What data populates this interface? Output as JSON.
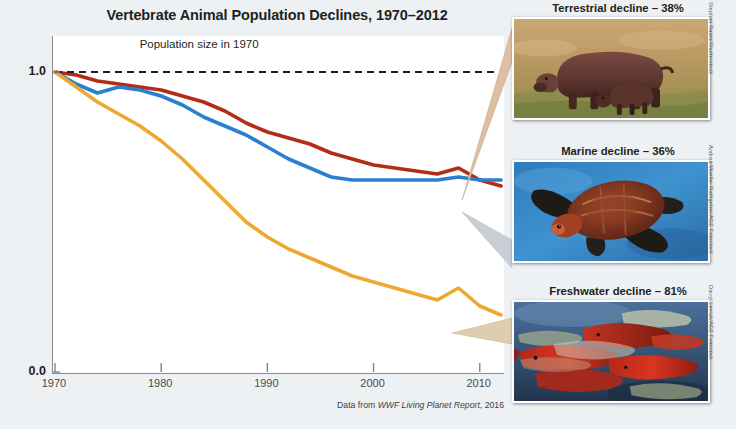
{
  "chart_data": {
    "type": "line",
    "title": "Vertebrate Animal Population Declines, 1970–2012",
    "xlabel": "",
    "ylabel": "Index value (1.0 = 1970)",
    "xlim": [
      1970,
      2012
    ],
    "ylim": [
      0.0,
      1.12
    ],
    "grid": false,
    "legend_position": "annotated-photos-right",
    "x_ticks": [
      "1970",
      "1980",
      "1990",
      "2000",
      "2010"
    ],
    "x_tick_values": [
      1970,
      1980,
      1990,
      2000,
      2010
    ],
    "y_ticks": [
      "1.0",
      "0.0"
    ],
    "y_tick_values": [
      1.0,
      0.0
    ],
    "annotations": [
      {
        "text": "Population size in 1970",
        "x": 1984,
        "y": 1.06,
        "kind": "reference-line-label"
      }
    ],
    "reference_line": {
      "y": 1.0,
      "style": "dashed",
      "color": "#231f20",
      "label": "Population size in 1970"
    },
    "source": "Data from WWF Living Planet Report, 2016",
    "source_prefix": "Data from ",
    "source_italic": "WWF Living Planet Report",
    "source_suffix": ", 2016",
    "x": [
      1970,
      1972,
      1974,
      1976,
      1978,
      1980,
      1982,
      1984,
      1986,
      1988,
      1990,
      1992,
      1994,
      1996,
      1998,
      2000,
      2002,
      2004,
      2006,
      2008,
      2010,
      2012
    ],
    "series": [
      {
        "name": "Terrestrial",
        "color": "#b32d16",
        "values": [
          1.0,
          0.99,
          0.97,
          0.96,
          0.95,
          0.94,
          0.92,
          0.9,
          0.87,
          0.83,
          0.8,
          0.78,
          0.76,
          0.73,
          0.71,
          0.69,
          0.68,
          0.67,
          0.66,
          0.68,
          0.64,
          0.62
        ]
      },
      {
        "name": "Marine",
        "color": "#2b7fd0",
        "values": [
          1.0,
          0.96,
          0.93,
          0.95,
          0.94,
          0.92,
          0.89,
          0.85,
          0.82,
          0.79,
          0.75,
          0.71,
          0.68,
          0.65,
          0.64,
          0.64,
          0.64,
          0.64,
          0.64,
          0.65,
          0.64,
          0.64
        ]
      },
      {
        "name": "Freshwater",
        "color": "#efa730",
        "values": [
          1.0,
          0.95,
          0.9,
          0.86,
          0.82,
          0.77,
          0.71,
          0.64,
          0.57,
          0.5,
          0.45,
          0.41,
          0.38,
          0.35,
          0.32,
          0.3,
          0.28,
          0.26,
          0.24,
          0.28,
          0.22,
          0.19
        ]
      }
    ]
  },
  "photos": [
    {
      "id": "terrestrial",
      "caption": "Terrestrial decline – 38%",
      "subject": "hippopotamus-with-calf",
      "credit": "Stephan Raats/Shutterstock"
    },
    {
      "id": "marine",
      "caption": "Marine decline – 36%",
      "subject": "sea-turtle",
      "credit": "Andrea Mueller-Rathgeber/AGE Fotostock"
    },
    {
      "id": "freshwater",
      "caption": "Freshwater decline – 81%",
      "subject": "spawning-salmon",
      "credit": "Darryl Leniuk/AGE Fotostock"
    }
  ],
  "colors": {
    "background": "#eef1f4",
    "panel": "#ffffff",
    "axis": "#8c8c8c",
    "text": "#231f20",
    "terrestrial": "#b32d16",
    "marine": "#2b7fd0",
    "freshwater": "#efa730",
    "connector": "#d9bfa6"
  }
}
